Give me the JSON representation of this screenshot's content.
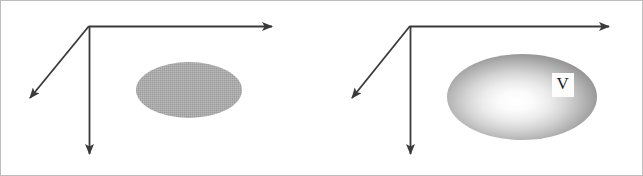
{
  "figure": {
    "type": "diagram",
    "background_color": "#ffffff",
    "border_color": "#b8b8b8",
    "stroke_color": "#3a3a3a",
    "width": 643,
    "height": 176,
    "panels": [
      {
        "id": "panel-left",
        "name": "left-panel",
        "axes": {
          "origin": {
            "x": 89,
            "y": 26
          },
          "arrows": [
            {
              "name": "x-axis-arrow",
              "direction": "right",
              "tip": {
                "x": 283,
                "y": 27
              }
            },
            {
              "name": "y-axis-arrow",
              "direction": "down",
              "tip": {
                "x": 89,
                "y": 165
              }
            },
            {
              "name": "z-axis-arrow",
              "direction": "lower-left-diagonal",
              "tip": {
                "x": 22,
                "y": 105
              }
            }
          ]
        },
        "shape": {
          "name": "flat-gray-ellipse",
          "kind": "ellipse",
          "center": {
            "x": 189,
            "y": 90
          },
          "rx": 53,
          "ry": 28,
          "fill_style": "flat",
          "fill_color": "#a9a9a9",
          "label": ""
        }
      },
      {
        "id": "panel-right",
        "name": "right-panel",
        "axes": {
          "origin": {
            "x": 410,
            "y": 26
          },
          "arrows": [
            {
              "name": "x-axis-arrow",
              "direction": "right",
              "tip": {
                "x": 620,
                "y": 27
              }
            },
            {
              "name": "y-axis-arrow",
              "direction": "down",
              "tip": {
                "x": 410,
                "y": 165
              }
            },
            {
              "name": "z-axis-arrow",
              "direction": "lower-left-diagonal",
              "tip": {
                "x": 344,
                "y": 105
              }
            }
          ]
        },
        "shape": {
          "name": "shaded-gradient-ellipse",
          "kind": "ellipse",
          "center": {
            "x": 522,
            "y": 97
          },
          "rx": 75,
          "ry": 43,
          "fill_style": "radial-gradient",
          "highlight_color": "#ffffff",
          "midtone_color": "#b6b6b6",
          "edge_color": "#6f6f6f",
          "highlight_center": {
            "x": 512,
            "y": 100
          },
          "label": "V"
        }
      }
    ],
    "labels": [
      {
        "name": "volume-label-v",
        "text": "V",
        "x": 552,
        "y": 73,
        "width": 22,
        "height": 24,
        "box_fill": "#fdfdfd",
        "text_color": "#1d1d1d"
      }
    ]
  }
}
